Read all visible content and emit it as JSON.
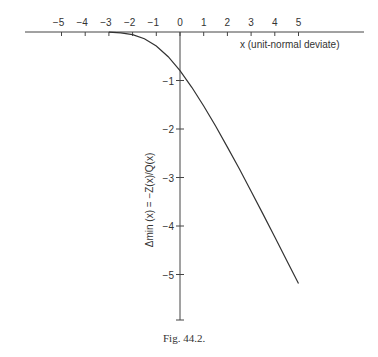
{
  "chart_data": {
    "type": "line",
    "title": "",
    "caption": "Fig. 44.2.",
    "xlabel": "x (unit-normal deviate)",
    "ylabel": "Δmin (x) = −Z(x)/Q(x)",
    "x_ticks": [
      -5,
      -4,
      -3,
      -2,
      -1,
      0,
      1,
      2,
      3,
      4,
      5
    ],
    "x_tick_labels": [
      "−5",
      "−4",
      "−3",
      "−2",
      "−1",
      "0",
      "1",
      "2",
      "3",
      "4",
      "5"
    ],
    "y_ticks": [
      -1,
      -2,
      -3,
      -4,
      -5
    ],
    "y_tick_labels": [
      "−1",
      "−2",
      "−3",
      "−4",
      "−5"
    ],
    "xlim": [
      -5,
      5
    ],
    "ylim": [
      -6,
      0
    ],
    "grid": false,
    "legend": null,
    "series": [
      {
        "name": "Δmin(x)",
        "x": [
          -3.0,
          -2.5,
          -2.0,
          -1.5,
          -1.0,
          -0.5,
          0.0,
          0.5,
          1.0,
          1.5,
          2.0,
          2.5,
          3.0,
          3.5,
          4.0,
          4.5,
          5.0
        ],
        "values": [
          -0.004,
          -0.018,
          -0.055,
          -0.139,
          -0.288,
          -0.509,
          -0.798,
          -1.141,
          -1.525,
          -1.939,
          -2.373,
          -2.821,
          -3.283,
          -3.751,
          -4.226,
          -4.705,
          -5.186
        ]
      }
    ]
  }
}
